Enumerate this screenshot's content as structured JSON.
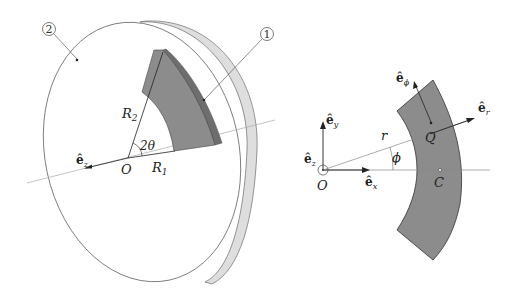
{
  "figure": {
    "left_panel": {
      "callouts": [
        {
          "id": "disk",
          "label": "2"
        },
        {
          "id": "sector",
          "label": "1"
        }
      ],
      "labels": {
        "R2": {
          "main": "R",
          "sub": "2"
        },
        "R1": {
          "main": "R",
          "sub": "1"
        },
        "angle": "2θ",
        "origin": "O",
        "ez": {
          "main": "ê",
          "sub": "z"
        }
      }
    },
    "right_panel": {
      "labels": {
        "ey": {
          "main": "ê",
          "sub": "y"
        },
        "ez": {
          "main": "ê",
          "sub": "z"
        },
        "ex": {
          "main": "ê",
          "sub": "x"
        },
        "er": {
          "main": "ê",
          "sub": "r"
        },
        "ephi": {
          "main": "ê",
          "sub": "ϕ"
        },
        "origin": "O",
        "r": "r",
        "phi": "ϕ",
        "Q": "Q",
        "C": "C"
      }
    },
    "colors": {
      "sector_fill": "#8c8c8c",
      "sector_side": "#6e6e6e",
      "disk_rim": "#d8d8d8",
      "line": "#333333",
      "axis_line": "#999999"
    }
  }
}
